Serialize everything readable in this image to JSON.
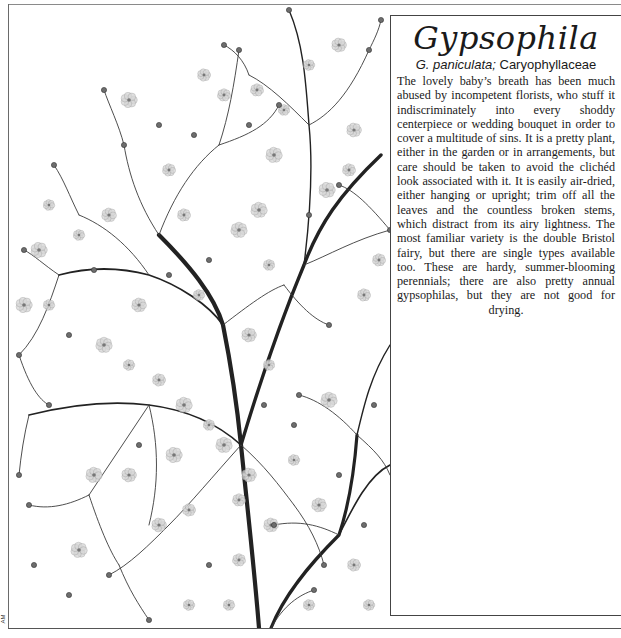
{
  "page": {
    "corner_mark": "AM"
  },
  "entry": {
    "title": "Gypsophila",
    "subtitle_species": "G. paniculata;",
    "subtitle_family": "Caryophyllaceae",
    "body": "The lovely baby’s breath has been much abused by incompetent florists, who stuff it indiscriminately into every shoddy centerpiece or wedding bouquet in order to cover a multitude of sins. It is a pretty plant, either in the garden or in arrangements, but care should be taken to avoid the clichéd look associated with it. It is easily air-dried, either hanging or upright; trim off all the leaves and the countless broken stems, which distract from its airy lightness. The most familiar variety is the double Bristol fairy, but there are single types available too. These are hardy, summer-blooming perennials; there are also pretty annual gypsophilas, but they are not good for drying."
  },
  "illustration": {
    "subject": "gypsophila-spray-botanical-illustration",
    "stem_color": "#222222",
    "flower_color": "#9a9a9a"
  }
}
